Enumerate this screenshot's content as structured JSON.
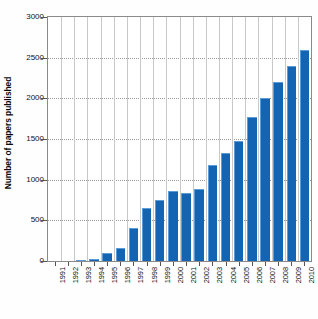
{
  "chart_data": {
    "type": "bar",
    "title": "",
    "subtitle": "",
    "xlabel": "",
    "ylabel": "Number of papers published",
    "categories": [
      "1991",
      "1992",
      "1993",
      "1994",
      "1995",
      "1996",
      "1997",
      "1998",
      "1999",
      "2000",
      "2001",
      "2002",
      "2003",
      "2004",
      "2005",
      "2006",
      "2007",
      "2008",
      "2009",
      "2010"
    ],
    "values": [
      0,
      5,
      15,
      25,
      100,
      165,
      410,
      650,
      745,
      865,
      835,
      890,
      1180,
      1325,
      1480,
      1765,
      2000,
      2195,
      2395,
      2600
    ],
    "ylim": [
      0,
      3000
    ],
    "yticks": [
      0,
      500,
      1000,
      1500,
      2000,
      2500,
      3000
    ],
    "ytick_labels": [
      "0",
      "500",
      "1000",
      "1500",
      "2000",
      "2500",
      "3000"
    ],
    "grid": true,
    "grid_axes": "both",
    "legend": false,
    "legend_position": "none",
    "series": [
      {
        "name": "Papers published",
        "color": "#1464b4",
        "values": [
          0,
          5,
          15,
          25,
          100,
          165,
          410,
          650,
          745,
          865,
          835,
          890,
          1180,
          1325,
          1480,
          1765,
          2000,
          2195,
          2395,
          2600
        ]
      }
    ],
    "bar_color": "#1464b4",
    "bar_edge_color": "#5b9bd8",
    "background_color": "#ffffff",
    "axis_color": "#8a8a8a",
    "gridline_color": "#c9c9c9",
    "xtick_rotation": -90
  }
}
